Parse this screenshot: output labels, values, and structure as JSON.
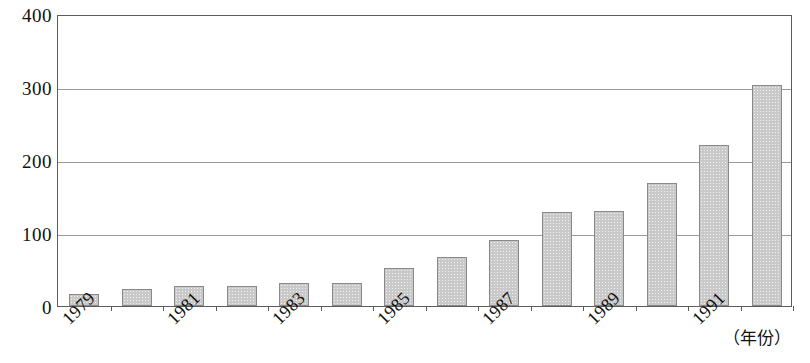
{
  "chart_data": {
    "type": "bar",
    "title": "",
    "subtitle": "",
    "xlabel": "（年份）",
    "ylabel": "",
    "categories": [
      "1979",
      "1980",
      "1981",
      "1982",
      "1983",
      "1984",
      "1985",
      "1986",
      "1987",
      "1988",
      "1989",
      "1990",
      "1991",
      "1992"
    ],
    "values": [
      17,
      23,
      27,
      27,
      32,
      32,
      52,
      67,
      91,
      129,
      130,
      168,
      221,
      303
    ],
    "tick_labels_shown": [
      "1979",
      "",
      "1981",
      "",
      "1983",
      "",
      "1985",
      "",
      "1987",
      "",
      "1989",
      "",
      "1991",
      ""
    ],
    "ylim": [
      0,
      400
    ],
    "yticks": [
      0,
      100,
      200,
      300,
      400
    ],
    "ytick_labels": [
      "0",
      "100",
      "200",
      "300",
      "400"
    ],
    "grid": true,
    "gridlines_at": [
      100,
      200,
      300
    ],
    "legend": null,
    "legend_position": "none",
    "bar_color": "#c9c9c9",
    "bar_border_color": "#8a8a8a",
    "axis_color": "#5c5c5c",
    "grid_color": "#9a9a9a",
    "annotations": []
  }
}
